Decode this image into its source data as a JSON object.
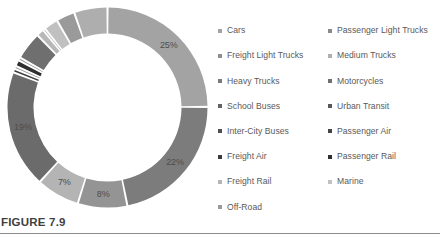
{
  "figure": {
    "caption": "FIGURE 7.9",
    "rule_color": "#8c8c8c"
  },
  "legend": {
    "columns": [
      {
        "name": "left-column",
        "items": [
          {
            "label": "Cars",
            "color": "#a3a3a3"
          },
          {
            "label": "Freight Light Trucks",
            "color": "#8f8f8f"
          },
          {
            "label": "Heavy Trucks",
            "color": "#7a7a7a"
          },
          {
            "label": "School Buses",
            "color": "#636363"
          },
          {
            "label": "Inter-City Buses",
            "color": "#4f4f4f"
          },
          {
            "label": "Freight Air",
            "color": "#3b3b3b"
          },
          {
            "label": "Freight Rail",
            "color": "#b5b5b5"
          },
          {
            "label": "Off-Road",
            "color": "#9a9a9a"
          }
        ]
      },
      {
        "name": "right-column",
        "items": [
          {
            "label": "Passenger Light Trucks",
            "color": "#898989"
          },
          {
            "label": "Medium Trucks",
            "color": "#b0b0b0"
          },
          {
            "label": "Motorcycles",
            "color": "#707070"
          },
          {
            "label": "Urban Transit",
            "color": "#585858"
          },
          {
            "label": "Passenger Air",
            "color": "#454545"
          },
          {
            "label": "Passenger Rail",
            "color": "#2f2f2f"
          },
          {
            "label": "Marine",
            "color": "#c2c2c2"
          }
        ]
      }
    ]
  },
  "chart_data": {
    "type": "pie",
    "variant": "donut",
    "title": "FIGURE 7.9",
    "xlabel": "",
    "ylabel": "",
    "legend_position": "right",
    "grid": false,
    "units": "percent",
    "inner_radius_ratio": 0.74,
    "start_angle_deg": -90,
    "gap_deg": 1.2,
    "labels_shown": [
      "25%",
      "22%",
      "8%",
      "7%",
      "19%"
    ],
    "categories": [
      "Cars",
      "Passenger Light Trucks",
      "Freight Light Trucks",
      "Medium Trucks",
      "Heavy Trucks",
      "Motorcycles",
      "School Buses",
      "Urban Transit",
      "Inter-City Buses",
      "Passenger Air",
      "Freight Air",
      "Passenger Rail",
      "Freight Rail",
      "Marine",
      "Off-Road"
    ],
    "values": [
      25,
      22,
      8,
      7,
      19,
      0.6,
      0.5,
      1.0,
      0.5,
      4.5,
      1.2,
      0.4,
      2.3,
      3.0,
      5.0
    ],
    "colors": [
      "#a3a3a3",
      "#898989",
      "#8f8f8f",
      "#b0b0b0",
      "#7a7a7a",
      "#707070",
      "#636363",
      "#585858",
      "#4f4f4f",
      "#454545",
      "#3b3b3b",
      "#2f2f2f",
      "#b5b5b5",
      "#c2c2c2",
      "#9a9a9a"
    ],
    "slices": [
      {
        "label": "Cars",
        "value": 25,
        "display": "25%",
        "color": "#a3a3a3",
        "show_label": true
      },
      {
        "label": "Passenger Light Trucks",
        "value": 22,
        "display": "22%",
        "color": "#7c7c7c",
        "show_label": true
      },
      {
        "label": "Freight Light Trucks",
        "value": 8,
        "display": "8%",
        "color": "#949494",
        "show_label": true
      },
      {
        "label": "Medium Trucks",
        "value": 7,
        "display": "7%",
        "color": "#b4b4b4",
        "show_label": true
      },
      {
        "label": "Heavy Trucks",
        "value": 19,
        "display": "19%",
        "color": "#6b6b6b",
        "show_label": true
      },
      {
        "label": "Motorcycles",
        "value": 0.6,
        "display": "",
        "color": "#3c3c3c",
        "show_label": false
      },
      {
        "label": "School Buses",
        "value": 0.5,
        "display": "",
        "color": "#8a8a8a",
        "show_label": false
      },
      {
        "label": "Urban Transit",
        "value": 1.0,
        "display": "",
        "color": "#2f2f2f",
        "show_label": false
      },
      {
        "label": "Inter-City Buses",
        "value": 0.5,
        "display": "",
        "color": "#9d9d9d",
        "show_label": false
      },
      {
        "label": "Passenger Air",
        "value": 4.5,
        "display": "",
        "color": "#6f6f6f",
        "show_label": false
      },
      {
        "label": "Freight Air",
        "value": 1.2,
        "display": "",
        "color": "#b8b8b8",
        "show_label": false
      },
      {
        "label": "Passenger Rail",
        "value": 0.4,
        "display": "",
        "color": "#868686",
        "show_label": false
      },
      {
        "label": "Freight Rail",
        "value": 2.3,
        "display": "",
        "color": "#c0c0c0",
        "show_label": false
      },
      {
        "label": "Marine",
        "value": 3.0,
        "display": "",
        "color": "#9a9a9a",
        "show_label": false
      },
      {
        "label": "Off-Road",
        "value": 5.4,
        "display": "",
        "color": "#aeaeae",
        "show_label": false
      }
    ]
  }
}
